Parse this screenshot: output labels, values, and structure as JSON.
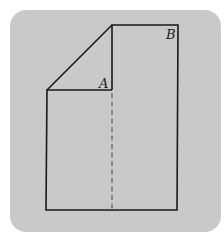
{
  "diagram": {
    "labels": {
      "a": "A",
      "b": "B"
    },
    "colors": {
      "background": "#ffffff",
      "card": "#c9c9c9",
      "stroke": "#1a1a1a",
      "fold_line": "#555555"
    },
    "shape": {
      "description": "Rectangular sheet with top-left corner folded down along a diagonal; dashed fold line below point A",
      "outline_points": [
        [
          112,
          25
        ],
        [
          178,
          25
        ],
        [
          177,
          210
        ],
        [
          46,
          210
        ],
        [
          47,
          90
        ],
        [
          112,
          90
        ]
      ],
      "diagonal": [
        [
          47,
          90
        ],
        [
          112,
          25
        ]
      ],
      "fold_line": [
        [
          112,
          92
        ],
        [
          112,
          210
        ]
      ],
      "label_a_pos": [
        100,
        88
      ],
      "label_b_pos": [
        167,
        39
      ]
    }
  }
}
